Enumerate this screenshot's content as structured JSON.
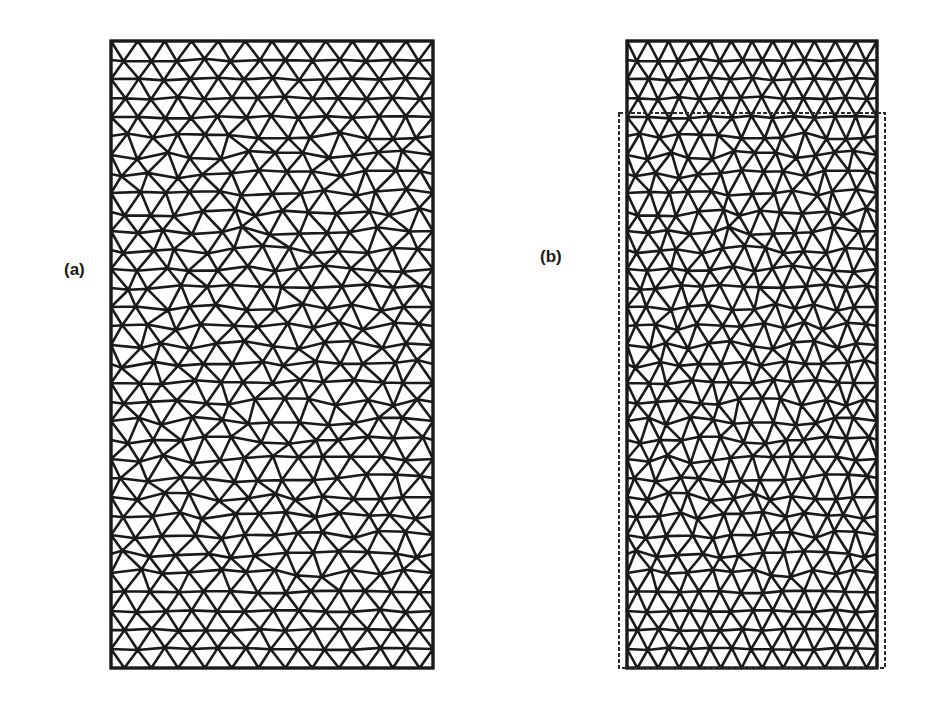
{
  "figure": {
    "panels": [
      {
        "id": "a",
        "label": "(a)",
        "mesh": {
          "x": 111,
          "y": 41,
          "width": 322,
          "height": 627,
          "columns": 12,
          "rows": 33,
          "seed": 7
        }
      },
      {
        "id": "b",
        "label": "(b)",
        "mesh": {
          "x": 627,
          "y": 41,
          "width": 250,
          "height": 627,
          "columns": 12,
          "rows": 33,
          "seed": 7
        },
        "reference_outline": {
          "x": 619,
          "y": 113,
          "width": 266,
          "height": 555,
          "style": "dashed"
        }
      }
    ],
    "colors": {
      "line": "#1a1a1a",
      "background": "#ffffff",
      "outline": "#2a2a2a"
    },
    "stroke_width": 2.6
  }
}
